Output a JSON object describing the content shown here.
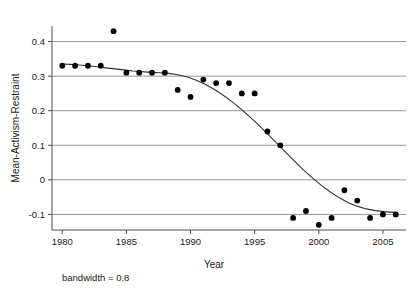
{
  "chart_data": {
    "type": "scatter",
    "title": "",
    "xlabel": "Year",
    "ylabel": "Mean-Activism-Restraint",
    "xlim": [
      1979.2,
      2006.8
    ],
    "ylim": [
      -0.145,
      0.445
    ],
    "xticks": [
      1980,
      1985,
      1990,
      1995,
      2000,
      2005
    ],
    "xtick_labels": [
      "1980",
      "1985",
      "1990",
      "1995",
      "2000",
      "2005"
    ],
    "yticks": [
      -0.1,
      0,
      0.1,
      0.2,
      0.3,
      0.4
    ],
    "ytick_labels": [
      "-0.1",
      "0",
      "0.1",
      "0.2",
      "0.3",
      "0.4"
    ],
    "grid": true,
    "grid_axis": "y",
    "legend": "none",
    "annotations": [
      {
        "text": "bandwidth = 0.8",
        "position": "below-x-axis-left"
      }
    ],
    "x": [
      1980,
      1981,
      1982,
      1983,
      1984,
      1985,
      1986,
      1987,
      1988,
      1989,
      1990,
      1991,
      1992,
      1993,
      1994,
      1995,
      1996,
      1997,
      1998,
      1999,
      2000,
      2001,
      2002,
      2003,
      2004,
      2005,
      2006
    ],
    "values": [
      0.33,
      0.33,
      0.33,
      0.33,
      0.43,
      0.31,
      0.31,
      0.31,
      0.31,
      0.26,
      0.24,
      0.29,
      0.28,
      0.28,
      0.25,
      0.25,
      0.14,
      0.1,
      -0.11,
      -0.09,
      -0.13,
      -0.11,
      -0.03,
      -0.06,
      -0.11,
      -0.1,
      -0.1
    ],
    "series": [
      {
        "name": "Mean-Activism-Restraint",
        "type": "scatter",
        "marker": "filled-circle",
        "color": "#000000",
        "x": [
          1980,
          1981,
          1982,
          1983,
          1984,
          1985,
          1986,
          1987,
          1988,
          1989,
          1990,
          1991,
          1992,
          1993,
          1994,
          1995,
          1996,
          1997,
          1998,
          1999,
          2000,
          2001,
          2002,
          2003,
          2004,
          2005,
          2006
        ],
        "values": [
          0.33,
          0.33,
          0.33,
          0.33,
          0.43,
          0.31,
          0.31,
          0.31,
          0.31,
          0.26,
          0.24,
          0.29,
          0.28,
          0.28,
          0.25,
          0.25,
          0.14,
          0.1,
          -0.11,
          -0.09,
          -0.13,
          -0.11,
          -0.03,
          -0.06,
          -0.11,
          -0.1,
          -0.1
        ]
      },
      {
        "name": "lowess smooth",
        "type": "line",
        "color": "#333333",
        "x": [
          1980.0,
          1980.6,
          1981.3,
          1982.0,
          1982.7,
          1983.4,
          1984.1,
          1984.8,
          1985.5,
          1986.2,
          1986.9,
          1987.6,
          1988.3,
          1989.0,
          1989.7,
          1990.4,
          1991.1,
          1991.8,
          1992.5,
          1993.2,
          1993.9,
          1994.6,
          1995.3,
          1996.0,
          1996.7,
          1997.4,
          1998.1,
          1998.8,
          1999.5,
          2000.2,
          2000.9,
          2001.6,
          2002.3,
          2003.0,
          2003.7,
          2004.4,
          2005.1,
          2005.8,
          2006.0
        ],
        "values": [
          0.335,
          0.334,
          0.332,
          0.33,
          0.327,
          0.324,
          0.321,
          0.318,
          0.315,
          0.313,
          0.311,
          0.31,
          0.308,
          0.304,
          0.298,
          0.289,
          0.277,
          0.263,
          0.246,
          0.227,
          0.206,
          0.183,
          0.159,
          0.133,
          0.107,
          0.08,
          0.054,
          0.029,
          0.006,
          -0.016,
          -0.035,
          -0.052,
          -0.066,
          -0.076,
          -0.084,
          -0.089,
          -0.092,
          -0.094,
          -0.094
        ]
      }
    ]
  },
  "figure": {
    "background": "#ffffff",
    "axis_color": "#4d4d4d",
    "grid_color": "#8c8c8c",
    "point_color": "#000000",
    "line_color": "#333333"
  }
}
